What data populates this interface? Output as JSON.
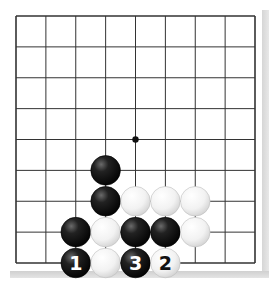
{
  "diagram": {
    "type": "go-board-fragment",
    "grid": {
      "columns": 9,
      "rows": 9,
      "hoshi": [
        {
          "col": 4,
          "row": 4
        }
      ]
    },
    "colors": {
      "line": "#333333",
      "black_stone": "#111111",
      "white_stone": "#f4f4f4",
      "shadow": "#d8d8d8"
    },
    "stones": [
      {
        "color": "black",
        "col": 3,
        "row": 5,
        "label": ""
      },
      {
        "color": "black",
        "col": 3,
        "row": 6,
        "label": ""
      },
      {
        "color": "white",
        "col": 4,
        "row": 6,
        "label": ""
      },
      {
        "color": "white",
        "col": 5,
        "row": 6,
        "label": ""
      },
      {
        "color": "white",
        "col": 6,
        "row": 6,
        "label": ""
      },
      {
        "color": "black",
        "col": 2,
        "row": 7,
        "label": ""
      },
      {
        "color": "white",
        "col": 3,
        "row": 7,
        "label": ""
      },
      {
        "color": "black",
        "col": 4,
        "row": 7,
        "label": ""
      },
      {
        "color": "black",
        "col": 5,
        "row": 7,
        "label": ""
      },
      {
        "color": "white",
        "col": 6,
        "row": 7,
        "label": ""
      },
      {
        "color": "black",
        "col": 2,
        "row": 8,
        "label": "1"
      },
      {
        "color": "white",
        "col": 3,
        "row": 8,
        "label": ""
      },
      {
        "color": "black",
        "col": 4,
        "row": 8,
        "label": "3"
      },
      {
        "color": "white",
        "col": 5,
        "row": 8,
        "label": "2"
      }
    ]
  }
}
